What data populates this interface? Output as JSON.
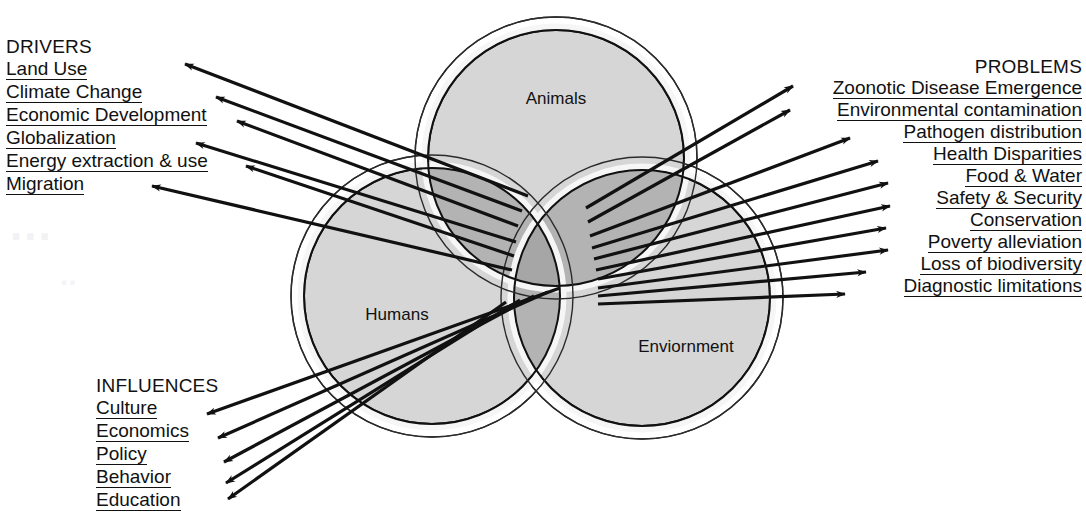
{
  "figure": {
    "type": "venn-diagram",
    "background": "#ffffff",
    "line_color": "#111111"
  },
  "circles": {
    "fill_single": "#d6d6d6",
    "fill_double": "#b3b3b3",
    "fill_triple": "#a6a6a6",
    "ring_color": "#ffffff",
    "stroke": "#111111",
    "items": [
      {
        "id": "animals",
        "label": "Animals",
        "cx": 556,
        "cy": 158,
        "r": 128,
        "lx": 556,
        "ly": 104
      },
      {
        "id": "humans",
        "label": "Humans",
        "cx": 432,
        "cy": 296,
        "r": 128,
        "lx": 397,
        "ly": 320
      },
      {
        "id": "environment",
        "label": "Enviornment",
        "cx": 642,
        "cy": 298,
        "r": 128,
        "lx": 686,
        "ly": 352
      }
    ]
  },
  "drivers": {
    "heading": "DRIVERS",
    "items": [
      "Land Use ",
      "Climate Change ",
      "Economic Development ",
      "Globalization ",
      "Energy extraction & use ",
      "Migration"
    ]
  },
  "problems": {
    "heading": "PROBLEMS",
    "items": [
      "Zoonotic Disease Emergence",
      "Environmental contamination",
      "Pathogen distribution",
      "Health Disparities",
      "Food & Water",
      "Safety & Security",
      "Conservation",
      "Poverty alleviation",
      "Loss of biodiversity",
      "Diagnostic limitations"
    ]
  },
  "influences": {
    "heading": "INFLUENCES",
    "items": [
      "Culture ",
      "Economics ",
      "Policy ",
      "Behavior ",
      "Education"
    ]
  },
  "arrows": {
    "drivers": [
      {
        "x1": 528,
        "y1": 196,
        "x2": 185,
        "y2": 64
      },
      {
        "x1": 522,
        "y1": 211,
        "x2": 216,
        "y2": 97
      },
      {
        "x1": 518,
        "y1": 226,
        "x2": 237,
        "y2": 121
      },
      {
        "x1": 516,
        "y1": 242,
        "x2": 196,
        "y2": 143
      },
      {
        "x1": 514,
        "y1": 256,
        "x2": 246,
        "y2": 166
      },
      {
        "x1": 512,
        "y1": 270,
        "x2": 152,
        "y2": 186
      }
    ],
    "problems": [
      {
        "x1": 586,
        "y1": 208,
        "x2": 793,
        "y2": 86
      },
      {
        "x1": 588,
        "y1": 222,
        "x2": 790,
        "y2": 110
      },
      {
        "x1": 590,
        "y1": 236,
        "x2": 850,
        "y2": 138
      },
      {
        "x1": 592,
        "y1": 248,
        "x2": 878,
        "y2": 161
      },
      {
        "x1": 594,
        "y1": 259,
        "x2": 888,
        "y2": 183
      },
      {
        "x1": 596,
        "y1": 270,
        "x2": 890,
        "y2": 206
      },
      {
        "x1": 598,
        "y1": 279,
        "x2": 886,
        "y2": 228
      },
      {
        "x1": 598,
        "y1": 288,
        "x2": 888,
        "y2": 250
      },
      {
        "x1": 598,
        "y1": 296,
        "x2": 866,
        "y2": 272
      },
      {
        "x1": 598,
        "y1": 304,
        "x2": 845,
        "y2": 294
      }
    ],
    "influences": [
      {
        "x1": 560,
        "y1": 288,
        "x2": 207,
        "y2": 414
      },
      {
        "x1": 548,
        "y1": 292,
        "x2": 218,
        "y2": 438
      },
      {
        "x1": 534,
        "y1": 296,
        "x2": 224,
        "y2": 462
      },
      {
        "x1": 520,
        "y1": 300,
        "x2": 226,
        "y2": 483
      },
      {
        "x1": 506,
        "y1": 302,
        "x2": 228,
        "y2": 499
      }
    ]
  },
  "artifact": {
    "ghost_text_1": "...",
    "ghost_text_2": ".."
  }
}
